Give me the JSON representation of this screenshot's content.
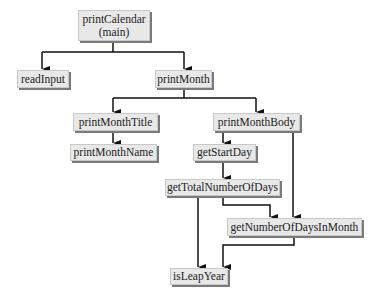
{
  "diagram": {
    "type": "method call hierarchy (structure chart)",
    "nodes": {
      "printCalendar": {
        "label": "printCalendar",
        "sublabel": "(main)"
      },
      "readInput": {
        "label": "readInput"
      },
      "printMonth": {
        "label": "printMonth"
      },
      "printMonthTitle": {
        "label": "printMonthTitle"
      },
      "printMonthBody": {
        "label": "printMonthBody"
      },
      "printMonthName": {
        "label": "printMonthName"
      },
      "getStartDay": {
        "label": "getStartDay"
      },
      "getTotalNumberOfDays": {
        "label": "getTotalNumberOfDays"
      },
      "getNumberOfDaysInMonth": {
        "label": "getNumberOfDaysInMonth"
      },
      "isLeapYear": {
        "label": "isLeapYear"
      }
    },
    "edges": [
      {
        "from": "printCalendar",
        "to": "readInput"
      },
      {
        "from": "printCalendar",
        "to": "printMonth"
      },
      {
        "from": "printMonth",
        "to": "printMonthTitle"
      },
      {
        "from": "printMonth",
        "to": "printMonthBody"
      },
      {
        "from": "printMonthTitle",
        "to": "printMonthName"
      },
      {
        "from": "printMonthBody",
        "to": "getStartDay"
      },
      {
        "from": "printMonthBody",
        "to": "getNumberOfDaysInMonth"
      },
      {
        "from": "getStartDay",
        "to": "getTotalNumberOfDays"
      },
      {
        "from": "getTotalNumberOfDays",
        "to": "isLeapYear"
      },
      {
        "from": "getTotalNumberOfDays",
        "to": "getNumberOfDaysInMonth"
      },
      {
        "from": "getNumberOfDaysInMonth",
        "to": "isLeapYear"
      }
    ],
    "colors": {
      "box_fill": "#e8e8e8",
      "box_shadow": "#7a7a7a",
      "line": "#111111",
      "text": "#222222"
    }
  }
}
